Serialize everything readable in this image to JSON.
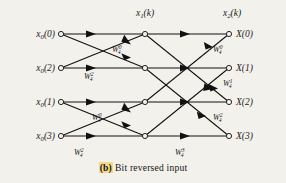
{
  "figure": {
    "caption_mark": "(b)",
    "caption_text": "Bit reversed input",
    "stage_labels": {
      "stage1": {
        "base": "x",
        "sub": "1",
        "arg": "(k)"
      },
      "stage2": {
        "base": "x",
        "sub": "2",
        "arg": "(k)"
      }
    },
    "inputs": [
      {
        "base": "x",
        "sub": "0",
        "arg": "(0)",
        "y": 34
      },
      {
        "base": "x",
        "sub": "0",
        "arg": "(2)",
        "y": 68
      },
      {
        "base": "x",
        "sub": "0",
        "arg": "(1)",
        "y": 102
      },
      {
        "base": "x",
        "sub": "0",
        "arg": "(3)",
        "y": 136
      }
    ],
    "outputs": [
      {
        "base": "X",
        "arg": "(0)",
        "y": 34
      },
      {
        "base": "X",
        "arg": "(1)",
        "y": 68
      },
      {
        "base": "X",
        "arg": "(2)",
        "y": 102
      },
      {
        "base": "X",
        "arg": "(3)",
        "y": 136
      }
    ],
    "twiddles": [
      {
        "base": "W",
        "sub": "4",
        "sup": "0",
        "x": 112,
        "y": 52
      },
      {
        "base": "W",
        "sub": "4",
        "sup": "2",
        "x": 84,
        "y": 79
      },
      {
        "base": "W",
        "sub": "4",
        "sup": "0",
        "x": 92,
        "y": 120
      },
      {
        "base": "W",
        "sub": "4",
        "sup": "2",
        "x": 74,
        "y": 155
      },
      {
        "base": "W",
        "sub": "4",
        "sup": "0",
        "x": 213,
        "y": 52
      },
      {
        "base": "W",
        "sub": "4",
        "sup": "1",
        "x": 223,
        "y": 86
      },
      {
        "base": "W",
        "sub": "4",
        "sup": "2",
        "x": 213,
        "y": 120
      },
      {
        "base": "W",
        "sub": "4",
        "sup": "3",
        "x": 175,
        "y": 155
      }
    ],
    "colors": {
      "background": "#f3f1ec",
      "ink": "#111111",
      "highlight": "#f5d98a"
    },
    "geometry": {
      "col_x": [
        61,
        145,
        229
      ],
      "row_y": [
        34,
        68,
        102,
        136
      ]
    }
  }
}
